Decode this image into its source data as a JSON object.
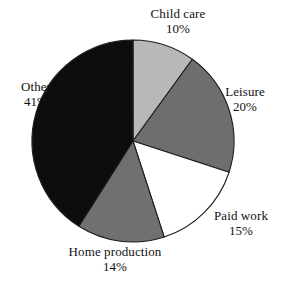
{
  "chart_data": {
    "type": "pie",
    "title": "",
    "subtitle": "",
    "xlabel": "",
    "ylabel": "",
    "legend_position": "none",
    "labels_position": "outside",
    "grid": false,
    "start_angle_deg": 0,
    "direction": "clockwise",
    "value_unit": "%",
    "categories": [
      "Child care",
      "Leisure",
      "Paid work",
      "Home production",
      "Other"
    ],
    "values": [
      10,
      20,
      15,
      14,
      41
    ],
    "value_labels": [
      "10%",
      "20%",
      "15%",
      "14%",
      "41%"
    ],
    "colors": [
      "#b8b8b8",
      "#6e6e6e",
      "#ffffff",
      "#707070",
      "#0d0d0d"
    ],
    "slices": [
      {
        "name": "Child care",
        "value": 10,
        "value_label": "10%",
        "color": "#b8b8b8",
        "start_angle_deg": 0,
        "end_angle_deg": 36
      },
      {
        "name": "Leisure",
        "value": 20,
        "value_label": "20%",
        "color": "#6e6e6e",
        "start_angle_deg": 36,
        "end_angle_deg": 108
      },
      {
        "name": "Paid work",
        "value": 15,
        "value_label": "15%",
        "color": "#ffffff",
        "start_angle_deg": 108,
        "end_angle_deg": 162
      },
      {
        "name": "Home production",
        "value": 14,
        "value_label": "14%",
        "color": "#707070",
        "start_angle_deg": 162,
        "end_angle_deg": 212.4
      },
      {
        "name": "Other",
        "value": 41,
        "value_label": "41%",
        "color": "#0d0d0d",
        "start_angle_deg": 212.4,
        "end_angle_deg": 360
      }
    ]
  },
  "geometry": {
    "center_x": 133,
    "center_y": 141,
    "radius": 101,
    "outline_color": "#1d1d1d"
  }
}
